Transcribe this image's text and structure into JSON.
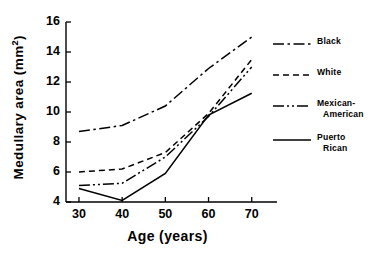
{
  "chart_data": {
    "type": "line",
    "title": "",
    "xlabel": "Age (years)",
    "ylabel": "Medullary area (mm2)",
    "ylabel_display": "Medullary area (mm",
    "ylabel_sup": "2",
    "ylabel_tail": ")",
    "x": [
      30,
      40,
      50,
      60,
      70
    ],
    "xlim": [
      27,
      74
    ],
    "ylim": [
      4,
      16
    ],
    "xticks": [
      30,
      40,
      50,
      60,
      70
    ],
    "yticks": [
      4,
      6,
      8,
      10,
      12,
      14,
      16
    ],
    "xtick_labels": [
      "30",
      "40",
      "50",
      "60",
      "70"
    ],
    "ytick_labels": [
      "4",
      "6",
      "8",
      "10",
      "12",
      "14",
      "16"
    ],
    "grid": false,
    "legend_position": "right",
    "series": [
      {
        "name": "Black",
        "label": "Black",
        "style": "dash-dot",
        "color": "#000000",
        "values": [
          8.7,
          9.1,
          10.4,
          12.9,
          15.0
        ]
      },
      {
        "name": "White",
        "label": "White",
        "style": "dashed",
        "color": "#000000",
        "values": [
          6.0,
          6.2,
          7.3,
          9.9,
          13.5
        ]
      },
      {
        "name": "Mexican-American",
        "label": "Mexican-",
        "label_line2": "American",
        "style": "dash-dot-dot",
        "color": "#000000",
        "values": [
          5.1,
          5.25,
          7.0,
          9.7,
          13.0
        ]
      },
      {
        "name": "Puerto Rican",
        "label": "Puerto",
        "label_line2": "Rican",
        "style": "solid",
        "color": "#000000",
        "values": [
          4.9,
          4.1,
          5.9,
          9.8,
          11.25
        ]
      }
    ]
  }
}
